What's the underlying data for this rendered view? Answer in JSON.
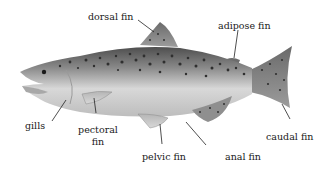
{
  "diagram": {
    "colors": {
      "background": "#ffffff",
      "body_dark": "#5a5a5a",
      "body_mid": "#9a9a9a",
      "body_light": "#e4e4e4",
      "spots": "#2b2b2b",
      "leader_line": "#222222",
      "text": "#1a1a1a"
    },
    "labels": {
      "dorsal_fin": "dorsal fin",
      "adipose_fin": "adipose fin",
      "gills": "gills",
      "pectoral_fin_line1": "pectoral",
      "pectoral_fin_line2": "fin",
      "pelvic_fin": "pelvic fin",
      "anal_fin": "anal fin",
      "caudal_fin": "caudal fin"
    }
  }
}
